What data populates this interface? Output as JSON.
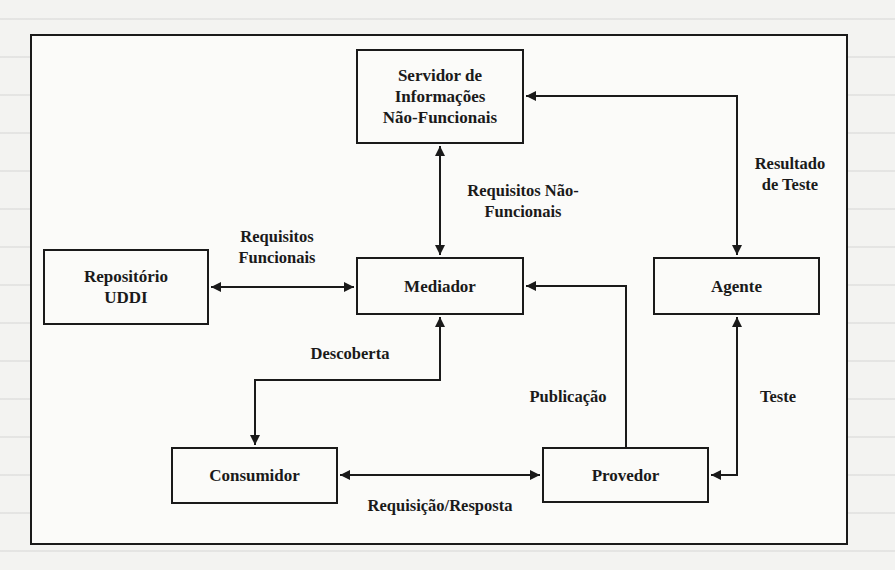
{
  "diagram": {
    "type": "architecture",
    "nodes": {
      "servidor": {
        "line1": "Servidor de",
        "line2": "Informações",
        "line3": "Não-Funcionais"
      },
      "mediador": {
        "line1": "Mediador"
      },
      "repositorio": {
        "line1": "Repositório",
        "line2": "UDDI"
      },
      "agente": {
        "line1": "Agente"
      },
      "consumidor": {
        "line1": "Consumidor"
      },
      "provedor": {
        "line1": "Provedor"
      }
    },
    "edges": {
      "requisitos_nao_funcionais": {
        "line1": "Requisitos Não-",
        "line2": "Funcionais",
        "from": "Mediador",
        "to": "Servidor de Informações Não-Funcionais",
        "direction": "bidirectional"
      },
      "resultado_de_teste": {
        "line1": "Resultado",
        "line2": "de Teste",
        "from": "Agente",
        "to": "Servidor de Informações Não-Funcionais / Agente",
        "direction": "bidirectional"
      },
      "requisitos_funcionais": {
        "line1": "Requisitos",
        "line2": "Funcionais",
        "from": "Repositório UDDI",
        "to": "Mediador",
        "direction": "bidirectional"
      },
      "descoberta": {
        "line1": "Descoberta",
        "from": "Consumidor",
        "to": "Mediador",
        "direction": "bidirectional"
      },
      "publicacao": {
        "line1": "Publicação",
        "from": "Provedor",
        "to": "Mediador",
        "direction": "to-mediador"
      },
      "teste": {
        "line1": "Teste",
        "from": "Provedor",
        "to": "Agente",
        "direction": "bidirectional"
      },
      "requisicao_resposta": {
        "line1": "Requisição/Resposta",
        "from": "Consumidor",
        "to": "Provedor",
        "direction": "bidirectional"
      }
    }
  }
}
